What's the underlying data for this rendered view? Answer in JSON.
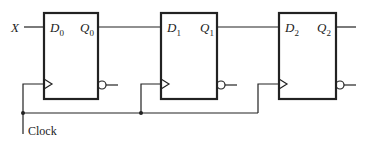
{
  "diagram": {
    "type": "shift-register",
    "input_label": "X",
    "clock_label": "Clock",
    "flipflops": [
      {
        "d_label": "D",
        "d_sub": "0",
        "q_label": "Q",
        "q_sub": "0"
      },
      {
        "d_label": "D",
        "d_sub": "1",
        "q_label": "Q",
        "q_sub": "1"
      },
      {
        "d_label": "D",
        "d_sub": "2",
        "q_label": "Q",
        "q_sub": "2"
      }
    ]
  }
}
